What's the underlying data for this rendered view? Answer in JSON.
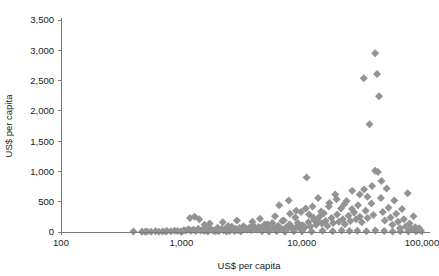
{
  "chart_data": {
    "type": "scatter",
    "title": "",
    "xlabel": "US$ per capita",
    "ylabel": "US$ per capita",
    "xscale": "log",
    "yscale": "linear",
    "xlim": [
      100,
      100000
    ],
    "ylim": [
      0,
      3500
    ],
    "grid": false,
    "legend": null,
    "marker": {
      "shape": "diamond",
      "color": "#939393",
      "size": 4
    },
    "xticks": [
      100,
      1000,
      10000,
      100000
    ],
    "xtick_labels": [
      "100",
      "1,000",
      "10,000",
      "100,000"
    ],
    "yticks": [
      0,
      500,
      1000,
      1500,
      2000,
      2500,
      3000,
      3500
    ],
    "ytick_labels": [
      "0",
      "500",
      "1,000",
      "1,500",
      "2,000",
      "2,500",
      "3,000",
      "3,500"
    ],
    "series": [
      {
        "name": "countries",
        "points": [
          [
            400,
            8
          ],
          [
            470,
            6
          ],
          [
            520,
            10
          ],
          [
            610,
            14
          ],
          [
            700,
            9
          ],
          [
            760,
            18
          ],
          [
            820,
            12
          ],
          [
            880,
            22
          ],
          [
            930,
            16
          ],
          [
            990,
            10
          ],
          [
            1050,
            30
          ],
          [
            1100,
            26
          ],
          [
            1150,
            44
          ],
          [
            1200,
            20
          ],
          [
            1260,
            38
          ],
          [
            1320,
            16
          ],
          [
            1380,
            52
          ],
          [
            1440,
            24
          ],
          [
            1500,
            34
          ],
          [
            1560,
            18
          ],
          [
            1620,
            60
          ],
          [
            1700,
            28
          ],
          [
            1780,
            42
          ],
          [
            1850,
            22
          ],
          [
            1930,
            14
          ],
          [
            2000,
            70
          ],
          [
            2080,
            36
          ],
          [
            2160,
            48
          ],
          [
            2250,
            26
          ],
          [
            2340,
            58
          ],
          [
            2430,
            32
          ],
          [
            2520,
            18
          ],
          [
            2620,
            88
          ],
          [
            2720,
            40
          ],
          [
            2820,
            54
          ],
          [
            2930,
            30
          ],
          [
            3040,
            66
          ],
          [
            3160,
            24
          ],
          [
            3280,
            96
          ],
          [
            3400,
            44
          ],
          [
            3530,
            36
          ],
          [
            3670,
            72
          ],
          [
            3800,
            28
          ],
          [
            3950,
            110
          ],
          [
            4100,
            50
          ],
          [
            4250,
            38
          ],
          [
            4400,
            84
          ],
          [
            4570,
            60
          ],
          [
            4740,
            32
          ],
          [
            4920,
            124
          ],
          [
            5100,
            46
          ],
          [
            5290,
            78
          ],
          [
            5490,
            40
          ],
          [
            5700,
            150
          ],
          [
            5910,
            62
          ],
          [
            6130,
            36
          ],
          [
            6360,
            104
          ],
          [
            6600,
            56
          ],
          [
            6850,
            44
          ],
          [
            7100,
            190
          ],
          [
            7370,
            70
          ],
          [
            7640,
            50
          ],
          [
            7930,
            130
          ],
          [
            8230,
            86
          ],
          [
            8530,
            58
          ],
          [
            8850,
            240
          ],
          [
            9180,
            96
          ],
          [
            9520,
            66
          ],
          [
            9880,
            330
          ],
          [
            10200,
            110
          ],
          [
            10600,
            76
          ],
          [
            11000,
            900
          ],
          [
            11400,
            160
          ],
          [
            11800,
            90
          ],
          [
            12300,
            420
          ],
          [
            12700,
            200
          ],
          [
            13200,
            120
          ],
          [
            13700,
            560
          ],
          [
            14200,
            260
          ],
          [
            14700,
            140
          ],
          [
            15300,
            310
          ],
          [
            15800,
            180
          ],
          [
            16400,
            100
          ],
          [
            17000,
            480
          ],
          [
            17700,
            230
          ],
          [
            18300,
            150
          ],
          [
            19000,
            620
          ],
          [
            19700,
            290
          ],
          [
            20400,
            170
          ],
          [
            21200,
            390
          ],
          [
            22000,
            210
          ],
          [
            22800,
            130
          ],
          [
            23600,
            510
          ],
          [
            24500,
            270
          ],
          [
            25400,
            180
          ],
          [
            26300,
            680
          ],
          [
            27300,
            320
          ],
          [
            28300,
            210
          ],
          [
            29400,
            440
          ],
          [
            30500,
            250
          ],
          [
            31600,
            160
          ],
          [
            32800,
            2540
          ],
          [
            34000,
            350
          ],
          [
            35300,
            230
          ],
          [
            36600,
            1780
          ],
          [
            38000,
            470
          ],
          [
            39400,
            280
          ],
          [
            40800,
            2950
          ],
          [
            42300,
            2610
          ],
          [
            43900,
            2240
          ],
          [
            45500,
            560
          ],
          [
            47200,
            330
          ],
          [
            49000,
            190
          ],
          [
            50800,
            720
          ],
          [
            52700,
            400
          ],
          [
            54700,
            240
          ],
          [
            56700,
            120
          ],
          [
            58800,
            520
          ],
          [
            61000,
            300
          ],
          [
            63300,
            170
          ],
          [
            65700,
            60
          ],
          [
            68100,
            380
          ],
          [
            70700,
            210
          ],
          [
            73300,
            90
          ],
          [
            76000,
            640
          ],
          [
            78900,
            140
          ],
          [
            81800,
            50
          ],
          [
            84900,
            260
          ],
          [
            88000,
            80
          ],
          [
            91300,
            30
          ],
          [
            94700,
            60
          ],
          [
            98000,
            20
          ],
          [
            1180,
            230
          ],
          [
            1290,
            250
          ],
          [
            1410,
            210
          ],
          [
            1560,
            120
          ],
          [
            1720,
            140
          ],
          [
            2210,
            160
          ],
          [
            2450,
            100
          ],
          [
            2900,
            190
          ],
          [
            3350,
            80
          ],
          [
            3900,
            170
          ],
          [
            4500,
            220
          ],
          [
            5200,
            130
          ],
          [
            6000,
            260
          ],
          [
            6900,
            180
          ],
          [
            8000,
            300
          ],
          [
            9300,
            150
          ],
          [
            10800,
            390
          ],
          [
            12500,
            240
          ],
          [
            14500,
            340
          ],
          [
            16800,
            420
          ],
          [
            19500,
            540
          ],
          [
            22600,
            460
          ],
          [
            26200,
            380
          ],
          [
            30400,
            620
          ],
          [
            35200,
            580
          ],
          [
            40800,
            1010
          ],
          [
            43000,
            990
          ],
          [
            46000,
            840
          ],
          [
            38500,
            760
          ],
          [
            33000,
            700
          ],
          [
            6500,
            440
          ],
          [
            7800,
            520
          ],
          [
            9000,
            350
          ],
          [
            11500,
            290
          ],
          [
            13500,
            180
          ],
          [
            500,
            4
          ],
          [
            560,
            6
          ],
          [
            650,
            3
          ],
          [
            740,
            7
          ],
          [
            1010,
            5
          ],
          [
            1660,
            9
          ],
          [
            2040,
            12
          ],
          [
            2380,
            7
          ],
          [
            2760,
            15
          ],
          [
            3120,
            9
          ],
          [
            4680,
            11
          ],
          [
            5350,
            8
          ],
          [
            6200,
            14
          ],
          [
            7250,
            6
          ],
          [
            8600,
            12
          ],
          [
            10100,
            18
          ],
          [
            12100,
            10
          ],
          [
            14900,
            22
          ],
          [
            18100,
            14
          ],
          [
            21500,
            26
          ],
          [
            25000,
            16
          ],
          [
            29000,
            20
          ],
          [
            34500,
            12
          ],
          [
            41000,
            24
          ],
          [
            48500,
            18
          ],
          [
            57000,
            10
          ],
          [
            66000,
            14
          ],
          [
            77000,
            8
          ],
          [
            89000,
            12
          ]
        ]
      }
    ]
  },
  "axes": {
    "x_label": "US$ per capita",
    "y_label": "US$ per capita"
  }
}
